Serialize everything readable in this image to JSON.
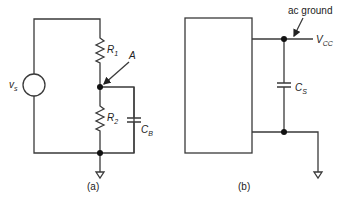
{
  "figure_a": {
    "caption": "(a)",
    "source": {
      "label": "v",
      "sub": "s"
    },
    "resistor_1": {
      "label": "R",
      "sub": "1"
    },
    "resistor_2": {
      "label": "R",
      "sub": "2"
    },
    "node_label": "A",
    "capacitor": {
      "label": "C",
      "sub": "B"
    }
  },
  "figure_b": {
    "caption": "(b)",
    "annotation": "ac ground",
    "supply": {
      "label": "V",
      "sub": "CC"
    },
    "capacitor": {
      "label": "C",
      "sub": "S"
    }
  }
}
